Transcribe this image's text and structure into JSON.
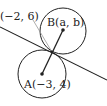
{
  "diagram": {
    "labels": {
      "point_p": "(−2, 6)",
      "point_b": "B(a, b)",
      "point_a": "A(−3, 4)"
    },
    "colors": {
      "stroke": "#222222",
      "guide": "#999999"
    }
  }
}
